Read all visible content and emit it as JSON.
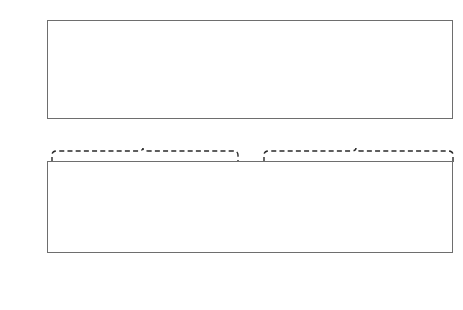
{
  "axis": {
    "y_label": "Share of country total, anti-state violent-action reports"
  },
  "legend": {
    "items": [
      {
        "label": "Colombia, 1986–1993 (n=3,847)",
        "color": "#1d1d1d",
        "key": "Colombia"
      },
      {
        "label": "Brazil, 2007–2011 (n=2,108)",
        "color": "#c9c9c9",
        "key": "Brazil"
      },
      {
        "label": "Mexico, 2008–2011 (n=5,644)",
        "color": "#ececec",
        "key": "Mexico"
      }
    ]
  },
  "chart_data": [
    {
      "type": "bar",
      "id": "top",
      "title": "",
      "xlabel": "",
      "ylabel": "Share of country total, anti-state violent-action reports",
      "ylim": [
        0,
        80
      ],
      "yticks": [
        0,
        20,
        40,
        60,
        80
      ],
      "ytick_labels": [
        "0%",
        "20%",
        "40%",
        "60%",
        "80%"
      ],
      "grid": true,
      "legend_position": "bottom",
      "categories": [
        "Enforcer-targeted*",
        "Terror tactics†"
      ],
      "category_sublabels": [
        "(violent corruption)",
        "(violent lobbying)"
      ],
      "series": [
        {
          "name": "Colombia",
          "values": [
            51,
            49
          ],
          "labels": [
            "51%",
            "49%"
          ]
        },
        {
          "name": "Brazil",
          "values": [
            68,
            32
          ],
          "labels": [
            "68%",
            "32%"
          ]
        },
        {
          "name": "Mexico",
          "values": [
            75,
            25
          ],
          "labels": [
            "75%",
            "25%"
          ]
        }
      ]
    },
    {
      "type": "bar",
      "id": "bottom",
      "title": "",
      "xlabel": "",
      "ylabel": "Share of country total, anti-state violent-action reports",
      "ylim": [
        0,
        60
      ],
      "yticks": [
        0,
        10,
        20,
        30,
        40,
        50,
        60
      ],
      "ytick_labels": [
        "0%",
        "10%",
        "20%",
        "30%",
        "40%",
        "50%",
        "60%"
      ],
      "grid": true,
      "legend_position": "bottom",
      "categories": [
        "Targeted",
        "Clash",
        "Unilateral",
        "Bombing",
        "Kidnapping",
        "Roadblock"
      ],
      "category_sublabels": [
        "killing",
        "",
        "attack",
        "",
        "",
        "/arson"
      ],
      "series": [
        {
          "name": "Colombia",
          "values": [
            36.5,
            4.2,
            9.4,
            23.2,
            21.2,
            1.6
          ]
        },
        {
          "name": "Brazil",
          "values": [
            3.0,
            60.0,
            11.2,
            0.4,
            5.2,
            16.5
          ]
        },
        {
          "name": "Mexico",
          "values": [
            19.8,
            26.6,
            21.0,
            0.9,
            12.4,
            15.2
          ]
        }
      ]
    }
  ],
  "braces": [
    {
      "name": "enforcer-targeted-brace",
      "links": "Enforcer-targeted*"
    },
    {
      "name": "terror-tactics-brace",
      "links": "Terror tactics†"
    }
  ]
}
